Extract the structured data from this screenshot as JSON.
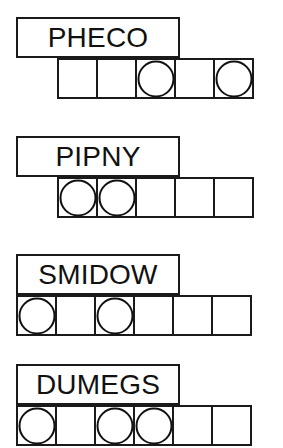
{
  "sheet": {
    "title": "Scrambled word puzzle worksheet",
    "background_color": "#ffffff",
    "ink_color": "#1a1a1a",
    "cell_size_px": 41,
    "rows": [
      {
        "word": "PHECO",
        "top_px": 17,
        "label_left_px": 16,
        "label_width_px": 164,
        "strip_left_px": 57,
        "cell_count": 5,
        "circled_indices": [
          2,
          4
        ],
        "cells": [
          {
            "index": 0,
            "circled": false
          },
          {
            "index": 1,
            "circled": false
          },
          {
            "index": 2,
            "circled": true
          },
          {
            "index": 3,
            "circled": false
          },
          {
            "index": 4,
            "circled": true
          }
        ]
      },
      {
        "word": "PIPNY",
        "top_px": 136,
        "label_left_px": 16,
        "label_width_px": 164,
        "strip_left_px": 57,
        "cell_count": 5,
        "circled_indices": [
          0,
          1
        ],
        "cells": [
          {
            "index": 0,
            "circled": true
          },
          {
            "index": 1,
            "circled": true
          },
          {
            "index": 2,
            "circled": false
          },
          {
            "index": 3,
            "circled": false
          },
          {
            "index": 4,
            "circled": false
          }
        ]
      },
      {
        "word": "SMIDOW",
        "top_px": 254,
        "label_left_px": 16,
        "label_width_px": 164,
        "strip_left_px": 16,
        "cell_count": 6,
        "circled_indices": [
          0,
          2
        ],
        "cells": [
          {
            "index": 0,
            "circled": true
          },
          {
            "index": 1,
            "circled": false
          },
          {
            "index": 2,
            "circled": true
          },
          {
            "index": 3,
            "circled": false
          },
          {
            "index": 4,
            "circled": false
          },
          {
            "index": 5,
            "circled": false
          }
        ]
      },
      {
        "word": "DUMEGS",
        "top_px": 364,
        "label_left_px": 16,
        "label_width_px": 164,
        "strip_left_px": 16,
        "cell_count": 6,
        "circled_indices": [
          0,
          2,
          3
        ],
        "cells": [
          {
            "index": 0,
            "circled": true
          },
          {
            "index": 1,
            "circled": false
          },
          {
            "index": 2,
            "circled": true
          },
          {
            "index": 3,
            "circled": true
          },
          {
            "index": 4,
            "circled": false
          },
          {
            "index": 5,
            "circled": false
          }
        ]
      }
    ]
  }
}
